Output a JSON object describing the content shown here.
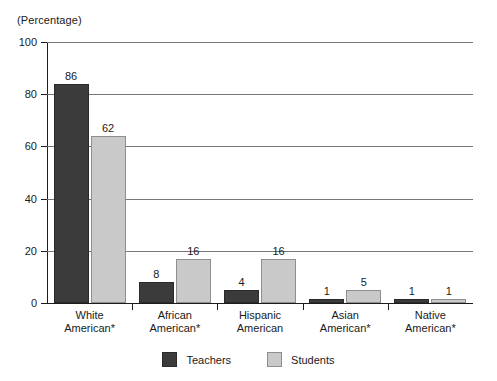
{
  "chart_data": {
    "type": "bar",
    "title": "",
    "subtitle": "",
    "xlabel": "",
    "ylabel": "(Percentage)",
    "ylim": [
      0,
      100
    ],
    "yticks": [
      0,
      20,
      40,
      60,
      80,
      100
    ],
    "ytick_labels": [
      "0",
      "20",
      "40",
      "60",
      "80",
      "100"
    ],
    "grid": true,
    "legend_position": "bottom-center",
    "categories": [
      "White American*",
      "African American*",
      "Hispanic American",
      "Asian American*",
      "Native American*"
    ],
    "category_lines": [
      [
        "White",
        "American*"
      ],
      [
        "African",
        "American*"
      ],
      [
        "Hispanic",
        "American"
      ],
      [
        "Asian",
        "American*"
      ],
      [
        "Native",
        "American*"
      ]
    ],
    "series": [
      {
        "name": "Teachers",
        "color": "#3b3b3b",
        "values": [
          86,
          8,
          4,
          1,
          1
        ],
        "drawn_heights": [
          84,
          8,
          5,
          1.5,
          1.5
        ],
        "labels": [
          "86",
          "8",
          "4",
          "1",
          "1"
        ]
      },
      {
        "name": "Students",
        "color": "#c9c9c9",
        "values": [
          62,
          16,
          16,
          5,
          1
        ],
        "drawn_heights": [
          64,
          17,
          17,
          5,
          1.5
        ],
        "labels": [
          "62",
          "16",
          "16",
          "5",
          "1"
        ]
      }
    ]
  },
  "legend": {
    "items": [
      {
        "label": "Teachers",
        "swatch": "teachers"
      },
      {
        "label": "Students",
        "swatch": "students"
      }
    ]
  },
  "colors": {
    "teachers": "#3b3b3b",
    "students": "#c9c9c9",
    "axis": "#1c1c1c",
    "gridline": "#767676",
    "text": "#1a1a1a",
    "background": "#ffffff"
  }
}
